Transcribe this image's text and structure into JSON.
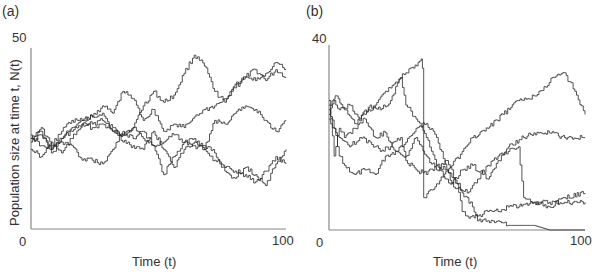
{
  "figure": {
    "panel_a_label": "(a)",
    "panel_b_label": "(b)",
    "ylabel": "Population size at time t, N(t)",
    "xlabel": "Time (t)",
    "a_ymax_tick": "50",
    "a_ymin_tick": "0",
    "a_xmax_tick": "100",
    "b_ymax_tick": "40",
    "b_ymin_tick": "0",
    "b_xmax_tick": "100"
  },
  "chart_data": [
    {
      "type": "line",
      "panel": "(a)",
      "title": "",
      "xlabel": "Time (t)",
      "ylabel": "Population size at time t, N(t)",
      "xlim": [
        0,
        100
      ],
      "ylim": [
        0,
        50
      ],
      "x_ticks": [
        "0",
        "100"
      ],
      "y_ticks": [
        "0",
        "50"
      ],
      "grid": false,
      "legend": null,
      "note": "Five stochastic population trajectories (random walks), approximate",
      "series": [
        {
          "name": "run1",
          "x": [
            0,
            4,
            8,
            12,
            16,
            20,
            24,
            28,
            32,
            36,
            40,
            44,
            48,
            52,
            56,
            60,
            64,
            68,
            72,
            76,
            80,
            84,
            88,
            92,
            96,
            100
          ],
          "values": [
            26,
            23,
            22,
            25,
            27,
            29,
            28,
            29,
            27,
            26,
            28,
            34,
            38,
            35,
            37,
            43,
            48,
            45,
            38,
            35,
            40,
            42,
            44,
            41,
            44,
            42
          ]
        },
        {
          "name": "run2",
          "x": [
            0,
            4,
            8,
            12,
            16,
            20,
            24,
            28,
            32,
            36,
            40,
            44,
            48,
            52,
            56,
            60,
            64,
            68,
            72,
            76,
            80,
            84,
            88,
            92,
            96,
            100
          ],
          "values": [
            24,
            26,
            22,
            25,
            28,
            30,
            31,
            34,
            32,
            38,
            36,
            30,
            33,
            27,
            29,
            28,
            31,
            33,
            34,
            36,
            39,
            42,
            41,
            43,
            46,
            44
          ]
        },
        {
          "name": "run3",
          "x": [
            0,
            4,
            8,
            12,
            16,
            20,
            24,
            28,
            32,
            36,
            40,
            44,
            48,
            52,
            56,
            60,
            64,
            68,
            72,
            76,
            80,
            84,
            88,
            92,
            96,
            100
          ],
          "values": [
            25,
            28,
            23,
            27,
            30,
            30,
            31,
            32,
            27,
            26,
            28,
            25,
            23,
            24,
            26,
            24,
            25,
            22,
            19,
            17,
            16,
            15,
            13,
            16,
            20,
            18
          ]
        },
        {
          "name": "run4",
          "x": [
            0,
            4,
            8,
            12,
            16,
            20,
            24,
            28,
            32,
            36,
            40,
            44,
            48,
            52,
            56,
            60,
            64,
            68,
            72,
            76,
            80,
            84,
            88,
            92,
            96,
            100
          ],
          "values": [
            22,
            20,
            24,
            21,
            25,
            29,
            29,
            30,
            28,
            24,
            23,
            22,
            27,
            22,
            17,
            22,
            24,
            23,
            21,
            16,
            14,
            17,
            15,
            12,
            18,
            22
          ]
        },
        {
          "name": "run5",
          "x": [
            0,
            4,
            8,
            12,
            16,
            20,
            24,
            28,
            32,
            36,
            40,
            44,
            48,
            52,
            56,
            60,
            64,
            68,
            72,
            76,
            80,
            84,
            88,
            92,
            96,
            100
          ],
          "values": [
            25,
            27,
            21,
            24,
            23,
            19,
            19,
            18,
            22,
            27,
            25,
            27,
            23,
            15,
            20,
            24,
            23,
            22,
            30,
            29,
            32,
            34,
            33,
            30,
            27,
            30
          ]
        }
      ]
    },
    {
      "type": "line",
      "panel": "(b)",
      "title": "",
      "xlabel": "Time (t)",
      "ylabel": "",
      "xlim": [
        0,
        100
      ],
      "ylim": [
        0,
        40
      ],
      "x_ticks": [
        "0",
        "100"
      ],
      "y_ticks": [
        "0",
        "40"
      ],
      "grid": false,
      "legend": null,
      "note": "Five stochastic population trajectories, several go extinct or drop sharply, approximate",
      "series": [
        {
          "name": "run1",
          "x": [
            0,
            3,
            6,
            10,
            14,
            18,
            22,
            26,
            30,
            33,
            36,
            37,
            37,
            42,
            48,
            52,
            56,
            62,
            68,
            74,
            80,
            84,
            88,
            92,
            96,
            100
          ],
          "values": [
            27,
            29,
            26,
            23,
            25,
            27,
            30,
            32,
            34,
            35,
            37,
            32,
            7,
            10,
            14,
            17,
            20,
            22,
            25,
            28,
            29,
            31,
            33,
            34,
            30,
            25
          ]
        },
        {
          "name": "run2",
          "x": [
            0,
            2,
            4,
            8,
            12,
            16,
            20,
            24,
            28,
            30,
            34,
            38,
            42,
            46,
            50,
            54,
            58,
            62,
            66,
            70,
            74,
            76,
            80,
            86,
            92,
            100
          ],
          "values": [
            25,
            28,
            26,
            27,
            24,
            27,
            26,
            28,
            33,
            27,
            24,
            20,
            14,
            13,
            10,
            8,
            11,
            14,
            16,
            17,
            18,
            7,
            6,
            5,
            7,
            8
          ]
        },
        {
          "name": "run3",
          "x": [
            0,
            2,
            4,
            6,
            10,
            14,
            18,
            22,
            26,
            30,
            34,
            38,
            42,
            46,
            48,
            52,
            56,
            60,
            62,
            66,
            70,
            76,
            80,
            86,
            92,
            100
          ],
          "values": [
            28,
            16,
            22,
            20,
            22,
            24,
            20,
            21,
            17,
            19,
            22,
            23,
            20,
            13,
            10,
            13,
            14,
            12,
            11,
            15,
            18,
            20,
            21,
            21,
            20,
            20
          ]
        },
        {
          "name": "run4",
          "x": [
            0,
            2,
            4,
            6,
            10,
            14,
            18,
            22,
            26,
            30,
            34,
            38,
            42,
            46,
            50,
            52,
            54,
            58,
            62,
            66,
            70,
            74,
            80,
            86,
            92,
            100
          ],
          "values": [
            26,
            22,
            16,
            14,
            12,
            13,
            12,
            16,
            17,
            16,
            20,
            16,
            13,
            15,
            10,
            4,
            3,
            3,
            4,
            4,
            5,
            5,
            6,
            6,
            6,
            6
          ]
        },
        {
          "name": "run5",
          "x": [
            0,
            2,
            4,
            8,
            12,
            16,
            20,
            24,
            28,
            30,
            34,
            38,
            42,
            46,
            50,
            54,
            56,
            58,
            62,
            66,
            70,
            74,
            80,
            86,
            92,
            100
          ],
          "values": [
            24,
            22,
            20,
            18,
            20,
            19,
            17,
            18,
            20,
            15,
            13,
            12,
            14,
            11,
            9,
            7,
            5,
            2,
            2,
            2,
            1,
            1,
            1,
            0,
            0,
            0
          ]
        }
      ]
    }
  ]
}
